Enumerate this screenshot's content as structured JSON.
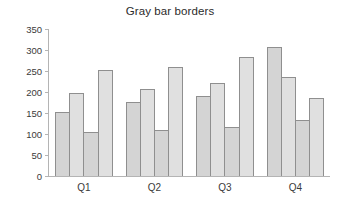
{
  "chart_data": {
    "type": "bar",
    "title": "Gray bar borders",
    "xlabel": "",
    "ylabel": "",
    "categories": [
      "Q1",
      "Q2",
      "Q3",
      "Q4"
    ],
    "series": [
      {
        "name": "Series 1",
        "values": [
          152,
          175,
          189,
          307
        ],
        "fill": "#d4d4d4",
        "border": "#8f8f8f"
      },
      {
        "name": "Series 2",
        "values": [
          196,
          207,
          221,
          234
        ],
        "fill": "#e0e0e0",
        "border": "#8f8f8f"
      },
      {
        "name": "Series 3",
        "values": [
          104,
          108,
          115,
          131
        ],
        "fill": "#d4d4d4",
        "border": "#8f8f8f"
      },
      {
        "name": "Series 4",
        "values": [
          251,
          259,
          283,
          184
        ],
        "fill": "#e0e0e0",
        "border": "#8f8f8f"
      }
    ],
    "ylim": [
      0,
      350
    ],
    "yticks": [
      0,
      50,
      100,
      150,
      200,
      250,
      300,
      350
    ],
    "ytick_labels": [
      "0",
      "50",
      "100",
      "150",
      "200",
      "250",
      "300",
      "350"
    ],
    "grid": false,
    "legend": "none",
    "axis_color": "#b4b4b4",
    "text_color": "#3a3a3a"
  },
  "layout": {
    "plot_left": 48,
    "plot_right": 330,
    "plot_top": 29,
    "plot_bottom": 176,
    "group_gap": 14,
    "bar_gap": 0
  }
}
